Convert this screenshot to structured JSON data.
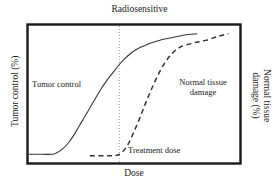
{
  "chart_data": {
    "type": "line",
    "title": "Radiosensitive",
    "xlabel": "Dose",
    "ylabel_left": "Tumor control (%)",
    "ylabel_right_line1": "Normal tissue",
    "ylabel_right_line2": "damage (%)",
    "grid": false,
    "legend": "none",
    "xlim": [
      0,
      100
    ],
    "ylim": [
      0,
      100
    ],
    "axes_ticks": "none",
    "series": [
      {
        "name": "Tumor control",
        "style": "solid",
        "color": "#333333",
        "label_text": "Tumor control",
        "x": [
          0,
          6,
          11,
          13,
          16,
          19,
          22,
          25,
          28,
          31,
          34,
          37,
          40,
          43,
          46,
          49,
          52,
          55,
          58,
          62,
          68,
          74,
          80
        ],
        "y": [
          5,
          5,
          5,
          6,
          9,
          14,
          21,
          29,
          37,
          45,
          53,
          60,
          66,
          72,
          77,
          81,
          84,
          86,
          88,
          90,
          92,
          94,
          95
        ]
      },
      {
        "name": "Normal tissue damage",
        "style": "dashed",
        "color": "#333333",
        "label_line1": "Normal tissue",
        "label_line2": "damage",
        "x": [
          29,
          36,
          41,
          44,
          47,
          50,
          53,
          56,
          59,
          62,
          65,
          68,
          72,
          78,
          84,
          90,
          95
        ],
        "y": [
          4,
          4,
          4,
          6,
          12,
          22,
          33,
          45,
          56,
          66,
          74,
          80,
          85,
          88,
          90,
          93,
          95
        ]
      }
    ],
    "annotations": [
      {
        "name": "treatment-dose",
        "text": "Treatment dose",
        "marker": "vertical-dotted-line",
        "x": 43,
        "color": "#9a9a9a"
      }
    ],
    "colors": {
      "frame": "#1a1a1a",
      "background": "#ffffff",
      "curve": "#333333",
      "dotted_line": "#9a9a9a"
    }
  }
}
